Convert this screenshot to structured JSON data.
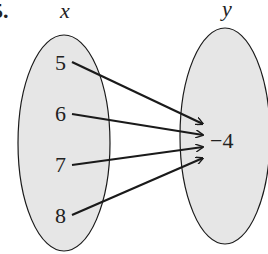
{
  "problem": {
    "number": "5."
  },
  "diagram": {
    "type": "mapping",
    "domain_label": "x",
    "range_label": "y",
    "domain": [
      "5",
      "6",
      "7",
      "8"
    ],
    "range": [
      "−4"
    ],
    "mappings": [
      {
        "from": "5",
        "to": "−4"
      },
      {
        "from": "6",
        "to": "−4"
      },
      {
        "from": "7",
        "to": "−4"
      },
      {
        "from": "8",
        "to": "−4"
      }
    ],
    "colors": {
      "ellipse_fill": "#e6e6e6",
      "stroke": "#1a1a1a"
    }
  }
}
